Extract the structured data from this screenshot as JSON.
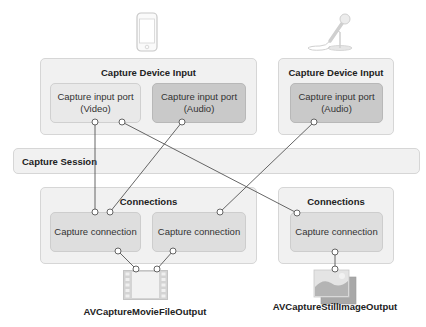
{
  "diagram": {
    "colors": {
      "outer_box": "#f1f1f1",
      "port_video": "#e9e9e9",
      "port_audio": "#c9c9c9",
      "connection": "#dedede",
      "line": "#555555"
    },
    "devices": [
      {
        "icon": "iphone-icon"
      },
      {
        "icon": "microphone-icon"
      }
    ],
    "inputs": [
      {
        "title": "Capture Device Input",
        "ports": [
          {
            "line1": "Capture input port",
            "line2": "(Video)"
          },
          {
            "line1": "Capture input port",
            "line2": "(Audio)"
          }
        ]
      },
      {
        "title": "Capture Device Input",
        "ports": [
          {
            "line1": "Capture input port",
            "line2": "(Audio)"
          }
        ]
      }
    ],
    "session": {
      "label": "Capture Session"
    },
    "connection_groups": [
      {
        "title": "Connections",
        "connections": [
          {
            "label": "Capture connection"
          },
          {
            "label": "Capture connection"
          }
        ]
      },
      {
        "title": "Connections",
        "connections": [
          {
            "label": "Capture connection"
          }
        ]
      }
    ],
    "outputs": [
      {
        "label": "AVCaptureMovieFileOutput",
        "icon": "film-strip-icon"
      },
      {
        "label": "AVCaptureStillImageOutput",
        "icon": "image-stack-icon"
      }
    ]
  }
}
